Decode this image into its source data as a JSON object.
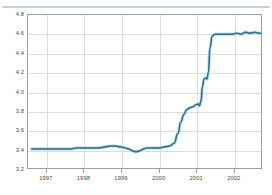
{
  "top_band": {
    "clipped_text": "· ·   ···        ····               ·····  ··              ·",
    "rule_color": "#c3d3dd"
  },
  "chart_data": {
    "type": "line",
    "title": "",
    "subtitle": "",
    "xlabel": "",
    "ylabel": "",
    "ylim": [
      3.2,
      4.8
    ],
    "xlim": [
      1996.5,
      2002.75
    ],
    "grid": true,
    "legend": "none",
    "line_color": "#2f6a7d",
    "halo_color": "#b9dff0",
    "y_ticks": [
      "4.8",
      "4.6",
      "4.4",
      "4.2",
      "4.0",
      "3.8",
      "3.6",
      "3.4",
      "3.2"
    ],
    "y_tick_values": [
      4.8,
      4.6,
      4.4,
      4.2,
      4.0,
      3.8,
      3.6,
      3.4,
      3.2
    ],
    "x_ticks": [
      "1997",
      "1998",
      "1999",
      "2000",
      "2001",
      "2002"
    ],
    "x_tick_values": [
      1997,
      1998,
      1999,
      2000,
      2001,
      2002
    ],
    "series": [
      {
        "name": "value",
        "x": [
          1996.6,
          1996.75,
          1996.9,
          1997.05,
          1997.2,
          1997.35,
          1997.5,
          1997.65,
          1997.8,
          1997.95,
          1998.1,
          1998.25,
          1998.4,
          1998.55,
          1998.7,
          1998.85,
          1999.0,
          1999.1,
          1999.2,
          1999.3,
          1999.4,
          1999.5,
          1999.6,
          1999.7,
          1999.85,
          2000.0,
          2000.15,
          2000.3,
          2000.42,
          2000.52,
          2000.6,
          2000.68,
          2000.76,
          2000.84,
          2000.92,
          2001.0,
          2001.06,
          2001.1,
          2001.14,
          2001.18,
          2001.22,
          2001.26,
          2001.3,
          2001.34,
          2001.38,
          2001.44,
          2001.52,
          2001.62,
          2001.74,
          2001.86,
          2001.98,
          2002.1,
          2002.22,
          2002.34,
          2002.46,
          2002.58,
          2002.68,
          2002.75
        ],
        "y": [
          3.4,
          3.4,
          3.4,
          3.4,
          3.4,
          3.4,
          3.4,
          3.4,
          3.41,
          3.41,
          3.41,
          3.41,
          3.41,
          3.42,
          3.43,
          3.43,
          3.42,
          3.41,
          3.4,
          3.38,
          3.37,
          3.38,
          3.4,
          3.41,
          3.41,
          3.41,
          3.42,
          3.43,
          3.46,
          3.56,
          3.68,
          3.76,
          3.81,
          3.83,
          3.84,
          3.86,
          3.87,
          3.85,
          3.9,
          4.05,
          4.13,
          4.14,
          4.13,
          4.2,
          4.45,
          4.58,
          4.6,
          4.6,
          4.6,
          4.6,
          4.6,
          4.61,
          4.6,
          4.62,
          4.61,
          4.62,
          4.61,
          4.61
        ]
      }
    ]
  }
}
